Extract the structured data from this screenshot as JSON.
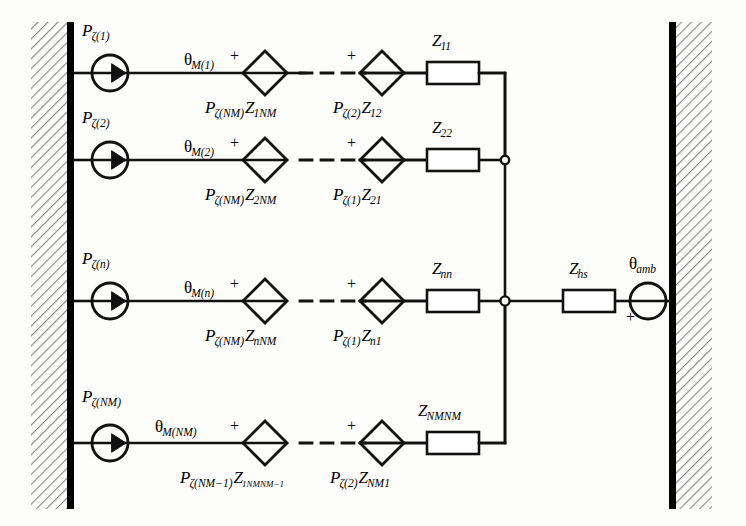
{
  "figure": {
    "type": "thermal-equivalent-circuit-diagram",
    "title": "",
    "walls": {
      "left_label": "hatched-wall-left",
      "right_label": "hatched-wall-right"
    }
  },
  "rows": [
    {
      "id": "row-1",
      "source_label": "Pζ(1)",
      "source_main": "P",
      "source_sub": "ζ(1)",
      "node_label": "θM(1)",
      "node_main": "θ",
      "node_sub": "M(1)",
      "diamond_left_plus": "+",
      "diamond_left_label_main": "P",
      "diamond_left_label_sub": "ζ(NM)",
      "diamond_left_label_main2": "Z",
      "diamond_left_label_sub2": "1NM",
      "diamond_right_plus": "+",
      "diamond_right_label_main": "P",
      "diamond_right_label_sub": "ζ(2)",
      "diamond_right_label_main2": "Z",
      "diamond_right_label_sub2": "12",
      "resistor_main": "Z",
      "resistor_sub": "11"
    },
    {
      "id": "row-2",
      "source_label": "Pζ(2)",
      "source_main": "P",
      "source_sub": "ζ(2)",
      "node_label": "θM(2)",
      "node_main": "θ",
      "node_sub": "M(2)",
      "diamond_left_plus": "+",
      "diamond_left_label_main": "P",
      "diamond_left_label_sub": "ζ(NM)",
      "diamond_left_label_main2": "Z",
      "diamond_left_label_sub2": "2NM",
      "diamond_right_plus": "+",
      "diamond_right_label_main": "P",
      "diamond_right_label_sub": "ζ(1)",
      "diamond_right_label_main2": "Z",
      "diamond_right_label_sub2": "21",
      "resistor_main": "Z",
      "resistor_sub": "22"
    },
    {
      "id": "row-3",
      "source_label": "Pζ(n)",
      "source_main": "P",
      "source_sub": "ζ(n)",
      "node_label": "θM(n)",
      "node_main": "θ",
      "node_sub": "M(n)",
      "diamond_left_plus": "+",
      "diamond_left_label_main": "P",
      "diamond_left_label_sub": "ζ(NM)",
      "diamond_left_label_main2": "Z",
      "diamond_left_label_sub2": "nNM",
      "diamond_right_plus": "+",
      "diamond_right_label_main": "P",
      "diamond_right_label_sub": "ζ(1)",
      "diamond_right_label_main2": "Z",
      "diamond_right_label_sub2": "n1",
      "resistor_main": "Z",
      "resistor_sub": "nn"
    },
    {
      "id": "row-4",
      "source_label": "Pζ(NM)",
      "source_main": "P",
      "source_sub": "ζ(NM)",
      "node_label": "θM(NM)",
      "node_main": "θ",
      "node_sub": "M(NM)",
      "diamond_left_plus": "+",
      "diamond_left_label_main": "P",
      "diamond_left_label_sub": "ζ(NM−1)",
      "diamond_left_label_main2": "Z",
      "diamond_left_label_sub2": "1NMNM−1",
      "diamond_right_plus": "+",
      "diamond_right_label_main": "P",
      "diamond_right_label_sub": "ζ(2)",
      "diamond_right_label_main2": "Z",
      "diamond_right_label_sub2": "NM1",
      "resistor_main": "Z",
      "resistor_sub": "NMNM"
    }
  ],
  "heatsink": {
    "resistor_main": "Z",
    "resistor_sub": "hs",
    "ambient_main": "θ",
    "ambient_sub": "amb",
    "ambient_plus": "+"
  },
  "colors": {
    "line": "#111111",
    "wall_bar": "#000000",
    "hatch": "#8a8a8a",
    "background": "#fdfdfb"
  }
}
